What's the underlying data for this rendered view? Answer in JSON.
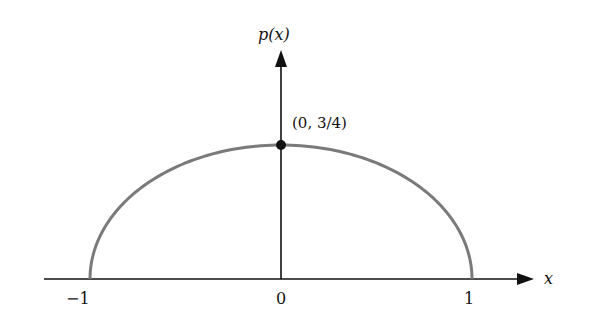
{
  "chart_data": {
    "type": "line",
    "title": "",
    "xlabel": "x",
    "ylabel": "p(x)",
    "function": "p(x) = (3/4)(1 - x^2)",
    "x_ticks": [
      "−1",
      "0",
      "1"
    ],
    "x_tick_values": [
      -1,
      0,
      1
    ],
    "xlim": [
      -1.5,
      1.65
    ],
    "ylim": [
      0,
      1.2
    ],
    "grid": false,
    "legend": null,
    "series": [
      {
        "name": "p(x)",
        "color": "#777777",
        "x": [
          -1,
          -0.75,
          -0.5,
          -0.25,
          0,
          0.25,
          0.5,
          0.75,
          1
        ],
        "y": [
          0,
          0.328,
          0.5625,
          0.703,
          0.75,
          0.703,
          0.5625,
          0.328,
          0
        ]
      }
    ],
    "annotations": [
      {
        "text": "(0, 3/4)",
        "point": [
          0,
          0.75
        ],
        "marker": "filled-circle"
      }
    ]
  },
  "labels": {
    "y_axis": "p(x)",
    "x_axis": "x",
    "tick_neg1": "−1",
    "tick_0": "0",
    "tick_1": "1",
    "peak": "(0, 3/4)"
  }
}
